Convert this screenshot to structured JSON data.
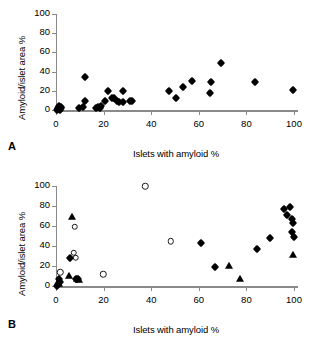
{
  "figure": {
    "panels": [
      {
        "letter": "A",
        "xlabel": "Islets with amyloid %",
        "ylabel": "Amyloid/islet area %"
      },
      {
        "letter": "B",
        "xlabel": "Islets with amyloid %",
        "ylabel": "Amyloid/islet area %"
      }
    ]
  },
  "axis": {
    "xticks": [
      "0",
      "20",
      "40",
      "60",
      "80",
      "100"
    ],
    "yticks": [
      "0",
      "20",
      "40",
      "60",
      "80",
      "100"
    ],
    "xlim": [
      0,
      100
    ],
    "ylim": [
      0,
      100
    ]
  },
  "chart_data": [
    {
      "type": "scatter",
      "title": "A",
      "xlabel": "Islets with amyloid %",
      "ylabel": "Amyloid/islet area %",
      "xlim": [
        0,
        100
      ],
      "ylim": [
        0,
        100
      ],
      "xticks": [
        0,
        20,
        40,
        60,
        80,
        100
      ],
      "yticks": [
        0,
        20,
        40,
        60,
        80,
        100
      ],
      "grid": false,
      "legend": "none",
      "series": [
        {
          "name": "filled-diamond",
          "marker": "filled diamond",
          "points": [
            [
              0.5,
              0.4
            ],
            [
              1.0,
              1.0
            ],
            [
              1.3,
              2.2
            ],
            [
              1.6,
              0.5
            ],
            [
              2.0,
              1.6
            ],
            [
              2.3,
              3.0
            ],
            [
              0.8,
              2.6
            ],
            [
              1.1,
              4.0
            ],
            [
              9.5,
              2.4
            ],
            [
              11.5,
              3.2
            ],
            [
              12.0,
              9.5
            ],
            [
              12.3,
              34.4
            ],
            [
              16.8,
              2.0
            ],
            [
              17.5,
              3.2
            ],
            [
              18.3,
              2.6
            ],
            [
              19.0,
              4.4
            ],
            [
              20.5,
              9.2
            ],
            [
              22.0,
              20.3
            ],
            [
              23.5,
              12.4
            ],
            [
              24.2,
              13.0
            ],
            [
              25.5,
              9.0
            ],
            [
              26.5,
              8.0
            ],
            [
              28.0,
              8.2
            ],
            [
              28.3,
              19.3
            ],
            [
              31.0,
              9.6
            ],
            [
              32.0,
              9.0
            ],
            [
              47.6,
              20.0
            ],
            [
              50.4,
              13.0
            ],
            [
              53.5,
              24.0
            ],
            [
              57.2,
              30.2
            ],
            [
              64.8,
              17.2
            ],
            [
              65.0,
              29.6
            ],
            [
              69.5,
              48.5
            ],
            [
              83.8,
              28.8
            ],
            [
              99.6,
              20.8
            ]
          ]
        }
      ]
    },
    {
      "type": "scatter",
      "title": "B",
      "xlabel": "Islets with amyloid %",
      "ylabel": "Amyloid/islet area %",
      "xlim": [
        0,
        100
      ],
      "ylim": [
        0,
        100
      ],
      "xticks": [
        0,
        20,
        40,
        60,
        80,
        100
      ],
      "yticks": [
        0,
        20,
        40,
        60,
        80,
        100
      ],
      "grid": false,
      "legend": "none",
      "series": [
        {
          "name": "filled-diamond",
          "marker": "filled diamond",
          "points": [
            [
              0.3,
              0.3
            ],
            [
              1.2,
              6.6
            ],
            [
              1.6,
              4.0
            ],
            [
              6.0,
              28.0
            ],
            [
              8.6,
              7.4
            ],
            [
              9.2,
              6.6
            ],
            [
              61.0,
              42.8
            ],
            [
              66.8,
              19.0
            ],
            [
              84.6,
              37.0
            ],
            [
              89.8,
              47.8
            ],
            [
              95.8,
              76.6
            ],
            [
              97.2,
              71.4
            ],
            [
              98.4,
              79.4
            ],
            [
              99.2,
              67.0
            ],
            [
              99.5,
              63.0
            ],
            [
              99.0,
              54.2
            ],
            [
              99.8,
              48.8
            ]
          ]
        },
        {
          "name": "open-circle",
          "marker": "open circle",
          "points": [
            [
              1.8,
              14.0
            ],
            [
              7.4,
              33.2
            ],
            [
              8.2,
              28.4
            ],
            [
              7.8,
              59.2
            ],
            [
              19.8,
              12.0
            ],
            [
              37.6,
              99.6
            ],
            [
              48.2,
              45.0
            ]
          ]
        },
        {
          "name": "filled-triangle",
          "marker": "filled triangle",
          "points": [
            [
              1.0,
              4.4
            ],
            [
              1.4,
              1.8
            ],
            [
              5.4,
              9.8
            ],
            [
              6.8,
              69.0
            ],
            [
              9.0,
              7.2
            ],
            [
              9.6,
              6.4
            ],
            [
              72.6,
              20.4
            ],
            [
              77.2,
              7.4
            ],
            [
              99.6,
              31.4
            ]
          ]
        }
      ]
    }
  ]
}
